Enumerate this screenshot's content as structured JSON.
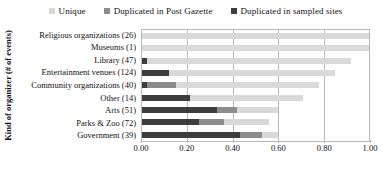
{
  "chart_data": {
    "type": "bar",
    "subtype": "stacked-horizontal",
    "title": "",
    "xlabel": "",
    "ylabel": "Kind of organizer (# of events)",
    "xlim": [
      0.0,
      1.0
    ],
    "xticks": [
      "0.00",
      "0.20",
      "0.40",
      "0.60",
      "0.80",
      "1.00"
    ],
    "xtick_values": [
      0.0,
      0.2,
      0.4,
      0.6,
      0.8,
      1.0
    ],
    "grid": true,
    "legend_position": "top",
    "categories": [
      "Religious organizations (26)",
      "Museums (1)",
      "Library (47)",
      "Entertainment venues (124)",
      "Community organizations (40)",
      "Other (14)",
      "Arts (51)",
      "Parks & Zoo (72)",
      "Government (39)"
    ],
    "series": [
      {
        "name": "Duplicated in sampled sites",
        "color": "#3d3d3d",
        "values": [
          0.0,
          0.0,
          0.02,
          0.12,
          0.02,
          0.21,
          0.33,
          0.25,
          0.43
        ]
      },
      {
        "name": "Duplicated in Post Gazette",
        "color": "#8c8c8c",
        "values": [
          0.0,
          0.0,
          0.0,
          0.0,
          0.13,
          0.0,
          0.09,
          0.11,
          0.1
        ]
      },
      {
        "name": "Unique",
        "color": "#d9d9d9",
        "values": [
          1.0,
          1.0,
          0.9,
          0.73,
          0.63,
          0.5,
          0.18,
          0.2,
          0.07
        ]
      }
    ]
  },
  "legend": {
    "items": [
      {
        "label": "Unique",
        "color": "#d9d9d9"
      },
      {
        "label": "Duplicated in Post Gazette",
        "color": "#8c8c8c"
      },
      {
        "label": "Duplicated in sampled sites",
        "color": "#3d3d3d"
      }
    ]
  },
  "axes": {
    "y_title": "Kind of organizer (# of events)",
    "grid_color": "#b9b9b9",
    "frame_color": "#b9b9b9"
  }
}
